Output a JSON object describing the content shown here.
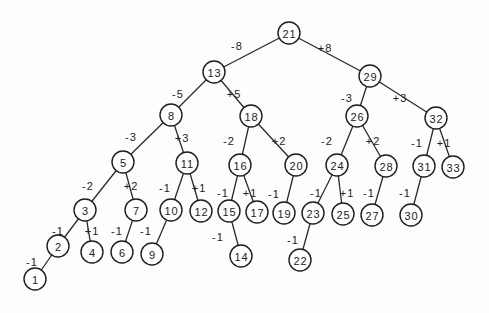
{
  "diagram": {
    "type": "binary-search-tree",
    "node_radius": 11,
    "nodes": [
      {
        "id": "21",
        "x": 289,
        "y": 33
      },
      {
        "id": "13",
        "x": 214,
        "y": 72
      },
      {
        "id": "29",
        "x": 370,
        "y": 76
      },
      {
        "id": "8",
        "x": 171,
        "y": 115
      },
      {
        "id": "18",
        "x": 251,
        "y": 116
      },
      {
        "id": "26",
        "x": 357,
        "y": 116
      },
      {
        "id": "32",
        "x": 436,
        "y": 118
      },
      {
        "id": "5",
        "x": 123,
        "y": 162
      },
      {
        "id": "11",
        "x": 187,
        "y": 163
      },
      {
        "id": "16",
        "x": 240,
        "y": 165
      },
      {
        "id": "20",
        "x": 296,
        "y": 165
      },
      {
        "id": "24",
        "x": 337,
        "y": 165
      },
      {
        "id": "28",
        "x": 386,
        "y": 166
      },
      {
        "id": "31",
        "x": 424,
        "y": 166
      },
      {
        "id": "33",
        "x": 453,
        "y": 167
      },
      {
        "id": "3",
        "x": 85,
        "y": 210
      },
      {
        "id": "7",
        "x": 136,
        "y": 210
      },
      {
        "id": "10",
        "x": 171,
        "y": 210
      },
      {
        "id": "12",
        "x": 201,
        "y": 211
      },
      {
        "id": "15",
        "x": 229,
        "y": 211
      },
      {
        "id": "17",
        "x": 257,
        "y": 212
      },
      {
        "id": "19",
        "x": 284,
        "y": 213
      },
      {
        "id": "23",
        "x": 313,
        "y": 213
      },
      {
        "id": "25",
        "x": 343,
        "y": 214
      },
      {
        "id": "27",
        "x": 372,
        "y": 215
      },
      {
        "id": "30",
        "x": 411,
        "y": 215
      },
      {
        "id": "2",
        "x": 58,
        "y": 246
      },
      {
        "id": "4",
        "x": 92,
        "y": 252
      },
      {
        "id": "6",
        "x": 122,
        "y": 252
      },
      {
        "id": "9",
        "x": 152,
        "y": 254
      },
      {
        "id": "14",
        "x": 241,
        "y": 256
      },
      {
        "id": "22",
        "x": 300,
        "y": 260
      },
      {
        "id": "1",
        "x": 35,
        "y": 279
      }
    ],
    "edges": [
      {
        "from": "21",
        "to": "13",
        "label": "-8",
        "lx": 237,
        "ly": 46
      },
      {
        "from": "21",
        "to": "29",
        "label": "+8",
        "lx": 325,
        "ly": 48
      },
      {
        "from": "13",
        "to": "8",
        "label": "-5",
        "lx": 178,
        "ly": 94
      },
      {
        "from": "13",
        "to": "18",
        "label": "+5",
        "lx": 234,
        "ly": 94
      },
      {
        "from": "29",
        "to": "26",
        "label": "-3",
        "lx": 347,
        "ly": 98
      },
      {
        "from": "29",
        "to": "32",
        "label": "+3",
        "lx": 400,
        "ly": 98
      },
      {
        "from": "8",
        "to": "5",
        "label": "-3",
        "lx": 131,
        "ly": 137
      },
      {
        "from": "8",
        "to": "11",
        "label": "+3",
        "lx": 182,
        "ly": 138
      },
      {
        "from": "18",
        "to": "16",
        "label": "-2",
        "lx": 229,
        "ly": 141
      },
      {
        "from": "18",
        "to": "20",
        "label": "+2",
        "lx": 279,
        "ly": 141
      },
      {
        "from": "26",
        "to": "24",
        "label": "-2",
        "lx": 327,
        "ly": 141
      },
      {
        "from": "26",
        "to": "28",
        "label": "+2",
        "lx": 373,
        "ly": 141
      },
      {
        "from": "32",
        "to": "31",
        "label": "-1",
        "lx": 417,
        "ly": 143
      },
      {
        "from": "32",
        "to": "33",
        "label": "+1",
        "lx": 444,
        "ly": 143
      },
      {
        "from": "5",
        "to": "3",
        "label": "-2",
        "lx": 88,
        "ly": 186
      },
      {
        "from": "5",
        "to": "7",
        "label": "+2",
        "lx": 131,
        "ly": 186
      },
      {
        "from": "11",
        "to": "10",
        "label": "-1",
        "lx": 165,
        "ly": 188
      },
      {
        "from": "11",
        "to": "12",
        "label": "+1",
        "lx": 199,
        "ly": 188
      },
      {
        "from": "16",
        "to": "15",
        "label": "-1",
        "lx": 223,
        "ly": 193
      },
      {
        "from": "16",
        "to": "17",
        "label": "+1",
        "lx": 250,
        "ly": 193
      },
      {
        "from": "20",
        "to": "19",
        "label": "-1",
        "lx": 274,
        "ly": 194
      },
      {
        "from": "24",
        "to": "23",
        "label": "-1",
        "lx": 316,
        "ly": 193
      },
      {
        "from": "24",
        "to": "25",
        "label": "+1",
        "lx": 347,
        "ly": 193
      },
      {
        "from": "28",
        "to": "27",
        "label": "-1",
        "lx": 369,
        "ly": 193
      },
      {
        "from": "31",
        "to": "30",
        "label": "-1",
        "lx": 405,
        "ly": 193
      },
      {
        "from": "3",
        "to": "2",
        "label": "-1",
        "lx": 58,
        "ly": 231
      },
      {
        "from": "3",
        "to": "4",
        "label": "+1",
        "lx": 92,
        "ly": 231
      },
      {
        "from": "7",
        "to": "6",
        "label": "-1",
        "lx": 117,
        "ly": 231
      },
      {
        "from": "10",
        "to": "9",
        "label": "-1",
        "lx": 146,
        "ly": 231
      },
      {
        "from": "15",
        "to": "14",
        "label": "-1",
        "lx": 218,
        "ly": 237
      },
      {
        "from": "23",
        "to": "22",
        "label": "-1",
        "lx": 293,
        "ly": 240
      },
      {
        "from": "2",
        "to": "1",
        "label": "-1",
        "lx": 32,
        "ly": 262
      }
    ]
  }
}
